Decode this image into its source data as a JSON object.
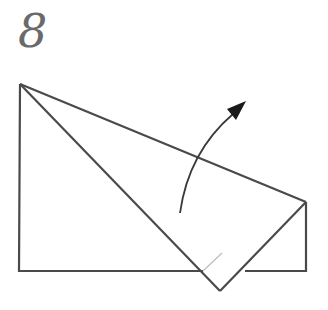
{
  "step": {
    "number": "8"
  },
  "diagram": {
    "stroke_color": "#4a4a4a",
    "arrow_color": "#1a1a1a",
    "inner_line_color": "#bdbdbd"
  }
}
